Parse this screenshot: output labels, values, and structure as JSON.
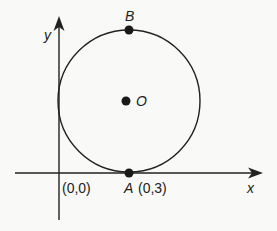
{
  "diagram": {
    "type": "geometry-circle-on-axes",
    "axes": {
      "x_label": "x",
      "y_label": "y",
      "origin_label": "(0,0)"
    },
    "circle": {
      "center_label": "O",
      "tangent_to": [
        "x-axis",
        "y-axis"
      ]
    },
    "points": [
      {
        "name": "B",
        "label": "B",
        "position": "top of circle"
      },
      {
        "name": "O",
        "label": "O",
        "position": "center of circle"
      },
      {
        "name": "A",
        "label": "A",
        "coord_label": "(0,3)",
        "position": "bottom of circle, on x-axis"
      }
    ],
    "colors": {
      "background": "#f9f9f7",
      "ink": "#222222"
    }
  }
}
